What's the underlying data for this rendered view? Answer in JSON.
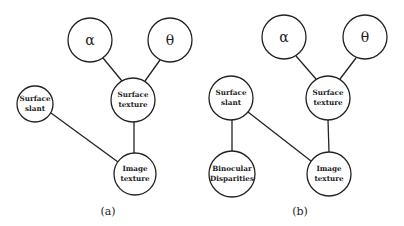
{
  "diagrams": [
    {
      "caption": "(a)",
      "nodes": {
        "alpha": {
          "label": "α"
        },
        "theta": {
          "label": "θ"
        },
        "surface_slant": {
          "line1": "Surface",
          "line2": "slant"
        },
        "surface_texture": {
          "line1": "Surface",
          "line2": "texture"
        },
        "image_texture": {
          "line1": "Image",
          "line2": "texture"
        }
      },
      "edges": [
        [
          "alpha",
          "surface_texture"
        ],
        [
          "theta",
          "surface_texture"
        ],
        [
          "surface_texture",
          "image_texture"
        ],
        [
          "surface_slant",
          "image_texture"
        ]
      ]
    },
    {
      "caption": "(b)",
      "nodes": {
        "alpha": {
          "label": "α"
        },
        "theta": {
          "label": "θ"
        },
        "surface_slant": {
          "line1": "Surface",
          "line2": "slant"
        },
        "surface_texture": {
          "line1": "Surface",
          "line2": "texture"
        },
        "binocular_disparities": {
          "line1": "Binocular",
          "line2": "Disparities"
        },
        "image_texture": {
          "line1": "Image",
          "line2": "texture"
        }
      },
      "edges": [
        [
          "alpha",
          "surface_texture"
        ],
        [
          "theta",
          "surface_texture"
        ],
        [
          "surface_texture",
          "image_texture"
        ],
        [
          "surface_slant",
          "image_texture"
        ],
        [
          "surface_slant",
          "binocular_disparities"
        ]
      ]
    }
  ]
}
